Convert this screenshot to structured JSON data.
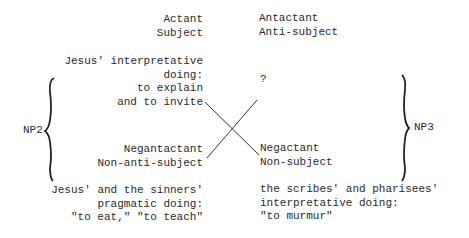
{
  "left_column": {
    "top_labels": [
      "Actant",
      "Subject"
    ],
    "content": [
      "Jesus' interpretative",
      "doing:",
      "to explain",
      "and to invite"
    ],
    "bottom_labels": [
      "Negantactant",
      "Non-anti-subject"
    ],
    "bottom_content": [
      "Jesus' and the sinners'",
      "pragmatic doing:",
      "\"to eat,\" \"to teach\""
    ]
  },
  "right_column": {
    "top_labels": [
      "Antactant",
      "Anti-subject"
    ],
    "content": [
      "?"
    ],
    "bottom_labels": [
      "Negactant",
      "Non-subject"
    ],
    "bottom_content": [
      "the scribes' and pharisees'",
      "interpretative doing:",
      "\"to murmur\""
    ]
  },
  "braces": {
    "left": "NP2",
    "right": "NP3"
  }
}
